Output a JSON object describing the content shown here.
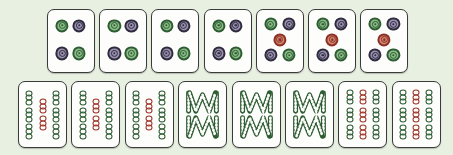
{
  "scene": {
    "title": "Mahjong tiles layout",
    "background_color": "#e8f0e2",
    "tile_face_color": "#fdfdfb",
    "tile_border_color": "#3b3b3b",
    "rows": 2,
    "total_tiles": 15
  },
  "palette": {
    "green_dark": "#2e5c33",
    "green_mid": "#4c8a4f",
    "green_light": "#8dbd88",
    "purple_dark": "#2f2b3f",
    "purple_mid": "#6b6280",
    "purple_light": "#9c93b0",
    "red_dark": "#8e2f22",
    "red_mid": "#b5432f",
    "red_light": "#d08a76",
    "bamboo_green": "#2e5c33",
    "bamboo_red": "#9e3328"
  },
  "rows": [
    {
      "name": "top-row",
      "suit": "dots",
      "count": 7,
      "tiles": [
        {
          "label": "4 Dots",
          "suit": "dots",
          "value": 4,
          "dots": [
            {
              "x": 31,
              "y": 25,
              "color": "green"
            },
            {
              "x": 68,
              "y": 25,
              "color": "purple"
            },
            {
              "x": 31,
              "y": 70,
              "color": "purple"
            },
            {
              "x": 68,
              "y": 70,
              "color": "green"
            }
          ]
        },
        {
          "label": "4 Dots",
          "suit": "dots",
          "value": 4,
          "dots": [
            {
              "x": 31,
              "y": 25,
              "color": "green"
            },
            {
              "x": 68,
              "y": 25,
              "color": "purple"
            },
            {
              "x": 31,
              "y": 70,
              "color": "purple"
            },
            {
              "x": 68,
              "y": 70,
              "color": "green"
            }
          ]
        },
        {
          "label": "4 Dots",
          "suit": "dots",
          "value": 4,
          "dots": [
            {
              "x": 31,
              "y": 25,
              "color": "green"
            },
            {
              "x": 68,
              "y": 25,
              "color": "purple"
            },
            {
              "x": 31,
              "y": 70,
              "color": "purple"
            },
            {
              "x": 68,
              "y": 70,
              "color": "green"
            }
          ]
        },
        {
          "label": "4 Dots",
          "suit": "dots",
          "value": 4,
          "dots": [
            {
              "x": 31,
              "y": 25,
              "color": "green"
            },
            {
              "x": 68,
              "y": 25,
              "color": "purple"
            },
            {
              "x": 31,
              "y": 70,
              "color": "purple"
            },
            {
              "x": 68,
              "y": 70,
              "color": "green"
            }
          ]
        },
        {
          "label": "5 Dots",
          "suit": "dots",
          "value": 5,
          "dots": [
            {
              "x": 30,
              "y": 23,
              "color": "green"
            },
            {
              "x": 70,
              "y": 23,
              "color": "purple"
            },
            {
              "x": 50,
              "y": 48,
              "color": "red"
            },
            {
              "x": 30,
              "y": 73,
              "color": "purple"
            },
            {
              "x": 70,
              "y": 73,
              "color": "green"
            }
          ]
        },
        {
          "label": "5 Dots",
          "suit": "dots",
          "value": 5,
          "dots": [
            {
              "x": 30,
              "y": 23,
              "color": "green"
            },
            {
              "x": 70,
              "y": 23,
              "color": "purple"
            },
            {
              "x": 50,
              "y": 48,
              "color": "red"
            },
            {
              "x": 30,
              "y": 73,
              "color": "purple"
            },
            {
              "x": 70,
              "y": 73,
              "color": "green"
            }
          ]
        },
        {
          "label": "5 Dots",
          "suit": "dots",
          "value": 5,
          "dots": [
            {
              "x": 30,
              "y": 23,
              "color": "green"
            },
            {
              "x": 70,
              "y": 23,
              "color": "purple"
            },
            {
              "x": 50,
              "y": 48,
              "color": "red"
            },
            {
              "x": 30,
              "y": 73,
              "color": "purple"
            },
            {
              "x": 70,
              "y": 73,
              "color": "green"
            }
          ]
        }
      ]
    },
    {
      "name": "bottom-row",
      "suit": "bamboo",
      "count": 8,
      "tiles": [
        {
          "label": "8 Bamboo",
          "suit": "bamboo",
          "value": 8,
          "style": "columns",
          "columns": [
            {
              "x": 22,
              "sticks": [
                {
                  "y": 24,
                  "color": "green"
                },
                {
                  "y": 50,
                  "color": "green"
                },
                {
                  "y": 76,
                  "color": "green"
                }
              ]
            },
            {
              "x": 50,
              "sticks": [
                {
                  "y": 37,
                  "color": "red"
                },
                {
                  "y": 63,
                  "color": "red"
                }
              ]
            },
            {
              "x": 78,
              "sticks": [
                {
                  "y": 24,
                  "color": "green"
                },
                {
                  "y": 50,
                  "color": "green"
                },
                {
                  "y": 76,
                  "color": "green"
                }
              ]
            }
          ]
        },
        {
          "label": "8 Bamboo",
          "suit": "bamboo",
          "value": 8,
          "style": "columns",
          "columns": [
            {
              "x": 22,
              "sticks": [
                {
                  "y": 24,
                  "color": "green"
                },
                {
                  "y": 50,
                  "color": "green"
                },
                {
                  "y": 76,
                  "color": "green"
                }
              ]
            },
            {
              "x": 50,
              "sticks": [
                {
                  "y": 37,
                  "color": "red"
                },
                {
                  "y": 63,
                  "color": "red"
                }
              ]
            },
            {
              "x": 78,
              "sticks": [
                {
                  "y": 24,
                  "color": "green"
                },
                {
                  "y": 50,
                  "color": "green"
                },
                {
                  "y": 76,
                  "color": "green"
                }
              ]
            }
          ]
        },
        {
          "label": "8 Bamboo",
          "suit": "bamboo",
          "value": 8,
          "style": "columns",
          "columns": [
            {
              "x": 22,
              "sticks": [
                {
                  "y": 24,
                  "color": "green"
                },
                {
                  "y": 50,
                  "color": "green"
                },
                {
                  "y": 76,
                  "color": "green"
                }
              ]
            },
            {
              "x": 50,
              "sticks": [
                {
                  "y": 37,
                  "color": "red"
                },
                {
                  "y": 63,
                  "color": "red"
                }
              ]
            },
            {
              "x": 78,
              "sticks": [
                {
                  "y": 24,
                  "color": "green"
                },
                {
                  "y": 50,
                  "color": "green"
                },
                {
                  "y": 76,
                  "color": "green"
                }
              ]
            }
          ]
        },
        {
          "label": "8 Bamboo",
          "suit": "bamboo",
          "value": 8,
          "style": "wm",
          "color": "green"
        },
        {
          "label": "8 Bamboo",
          "suit": "bamboo",
          "value": 8,
          "style": "wm",
          "color": "green"
        },
        {
          "label": "8 Bamboo",
          "suit": "bamboo",
          "value": 8,
          "style": "wm",
          "color": "green"
        },
        {
          "label": "9 Bamboo",
          "suit": "bamboo",
          "value": 9,
          "style": "grid",
          "columns": [
            {
              "x": 22,
              "sticks": [
                {
                  "y": 23,
                  "color": "green"
                },
                {
                  "y": 50,
                  "color": "green"
                },
                {
                  "y": 77,
                  "color": "green"
                }
              ]
            },
            {
              "x": 50,
              "sticks": [
                {
                  "y": 23,
                  "color": "red"
                },
                {
                  "y": 50,
                  "color": "red"
                },
                {
                  "y": 77,
                  "color": "red"
                }
              ]
            },
            {
              "x": 78,
              "sticks": [
                {
                  "y": 23,
                  "color": "green"
                },
                {
                  "y": 50,
                  "color": "green"
                },
                {
                  "y": 77,
                  "color": "green"
                }
              ]
            }
          ]
        },
        {
          "label": "9 Bamboo",
          "suit": "bamboo",
          "value": 9,
          "style": "grid",
          "columns": [
            {
              "x": 22,
              "sticks": [
                {
                  "y": 23,
                  "color": "green"
                },
                {
                  "y": 50,
                  "color": "green"
                },
                {
                  "y": 77,
                  "color": "green"
                }
              ]
            },
            {
              "x": 50,
              "sticks": [
                {
                  "y": 23,
                  "color": "red"
                },
                {
                  "y": 50,
                  "color": "red"
                },
                {
                  "y": 77,
                  "color": "red"
                }
              ]
            },
            {
              "x": 78,
              "sticks": [
                {
                  "y": 23,
                  "color": "green"
                },
                {
                  "y": 50,
                  "color": "green"
                },
                {
                  "y": 77,
                  "color": "green"
                }
              ]
            }
          ]
        }
      ]
    }
  ]
}
